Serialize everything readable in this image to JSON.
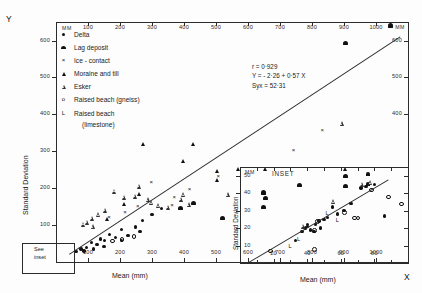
{
  "figure": {
    "y_axis_symbol": "Y",
    "x_axis_symbol": "X"
  },
  "main": {
    "unit_top_left": "MM",
    "unit_top_right": "MM",
    "xlabel": "Mean  (mm)",
    "ylabel": "Standard   Deviation",
    "top_ticks": [
      "100",
      "200",
      "300",
      "400",
      "500",
      "600",
      "700",
      "800",
      "900",
      "1000"
    ],
    "bottom_ticks": [
      "100",
      "200",
      "300",
      "400",
      "500",
      "600",
      "700",
      "800",
      "900",
      "1000"
    ],
    "left_ticks": [
      "600",
      "500",
      "400",
      "300",
      "200",
      "100"
    ],
    "right_ticks": [
      "600",
      "500",
      "400"
    ],
    "see_inset_line1": "See",
    "see_inset_line2": "inset"
  },
  "inset": {
    "title": "INSET",
    "unit": "MM",
    "xlabel": "Mean (mm)",
    "ylabel": "Standard   Deviation",
    "y_ticks": [
      "50",
      "40",
      "30",
      "20",
      "10"
    ],
    "x_ticks": [
      "20",
      "40",
      "60",
      "80"
    ]
  },
  "legend": {
    "items": [
      {
        "symbol": "●",
        "cls": "m-delta-leg",
        "label": "Delta"
      },
      {
        "symbol": "⬟",
        "cls": "m-lag-leg",
        "label": "Lag deposit"
      },
      {
        "symbol": "×",
        "cls": "m-ice-leg",
        "label": "Ice - contact"
      },
      {
        "symbol": "▲",
        "cls": "m-mor-leg",
        "label": "Moraine and till"
      },
      {
        "symbol": "△",
        "cls": "m-esk-leg",
        "label": "Esker"
      },
      {
        "symbol": "o",
        "cls": "m-gne-leg",
        "label": "Raised beach (gneiss)"
      },
      {
        "symbol": "L",
        "cls": "m-lim-leg",
        "label": "Raised beach"
      }
    ],
    "last_continuation": "(limestone)"
  },
  "stats": {
    "correlation": "r = 0·929",
    "equation": "Y = - 2·26 + 0·57 X",
    "stderr": "Syx = 52·31"
  },
  "chart_data": {
    "type": "scatter",
    "title": "",
    "xlabel": "Mean (mm)",
    "ylabel": "Standard Deviation",
    "xlim": [
      0,
      1100
    ],
    "ylim": [
      0,
      650
    ],
    "grid": false,
    "regression": {
      "intercept": -2.26,
      "slope": 0.57,
      "r": 0.929,
      "syx": 52.31
    },
    "series": [
      {
        "name": "Delta",
        "marker": "filled-circle",
        "points": [
          [
            62,
            28
          ],
          [
            78,
            35
          ],
          [
            95,
            40
          ],
          [
            110,
            52
          ],
          [
            128,
            48
          ],
          [
            140,
            62
          ],
          [
            152,
            58
          ],
          [
            168,
            75
          ],
          [
            185,
            66
          ],
          [
            205,
            88
          ],
          [
            225,
            72
          ],
          [
            248,
            95
          ],
          [
            270,
            112
          ],
          [
            300,
            128
          ],
          [
            330,
            145
          ],
          [
            205,
            58
          ],
          [
            150,
            42
          ],
          [
            118,
            35
          ],
          [
            88,
            30
          ],
          [
            262,
            82
          ]
        ]
      },
      {
        "name": "Lag deposit",
        "marker": "blob",
        "points": [
          [
            1045,
            640
          ],
          [
            905,
            592
          ],
          [
            648,
            188
          ],
          [
            655,
            172
          ],
          [
            760,
            208
          ],
          [
            905,
            232
          ],
          [
            905,
            205
          ],
          [
            648,
            148
          ],
          [
            975,
            238
          ],
          [
            975,
            212
          ],
          [
            390,
            145
          ],
          [
            520,
            118
          ],
          [
            430,
            160
          ]
        ]
      },
      {
        "name": "Ice-contact",
        "marker": "cross",
        "points": [
          [
            300,
            215
          ],
          [
            420,
            198
          ],
          [
            510,
            232
          ],
          [
            745,
            302
          ],
          [
            835,
            358
          ],
          [
            365,
            155
          ],
          [
            258,
            152
          ],
          [
            218,
            135
          ],
          [
            168,
            122
          ],
          [
            372,
            175
          ]
        ]
      },
      {
        "name": "Moraine and till",
        "marker": "filled-triangle",
        "points": [
          [
            275,
            318
          ],
          [
            430,
            318
          ],
          [
            398,
            272
          ],
          [
            505,
            245
          ],
          [
            570,
            252
          ],
          [
            655,
            250
          ],
          [
            505,
            220
          ],
          [
            262,
            182
          ],
          [
            215,
            155
          ],
          [
            160,
            115
          ],
          [
            905,
            252
          ]
        ]
      },
      {
        "name": "Esker",
        "marker": "open-triangle",
        "points": [
          [
            185,
            192
          ],
          [
            215,
            175
          ],
          [
            248,
            178
          ],
          [
            262,
            205
          ],
          [
            290,
            168
          ],
          [
            300,
            160
          ],
          [
            322,
            152
          ],
          [
            352,
            148
          ],
          [
            392,
            170
          ],
          [
            400,
            182
          ],
          [
            418,
            155
          ],
          [
            540,
            182
          ],
          [
            895,
            375
          ],
          [
            155,
            140
          ],
          [
            135,
            128
          ],
          [
            115,
            118
          ],
          [
            98,
            108
          ],
          [
            88,
            102
          ],
          [
            118,
            95
          ]
        ]
      },
      {
        "name": "Raised beach (gneiss)",
        "marker": "open-circle",
        "points": [
          [
            175,
            58
          ],
          [
            205,
            62
          ],
          [
            242,
            70
          ]
        ]
      },
      {
        "name": "Raised beach (limestone)",
        "marker": "L",
        "points": []
      }
    ],
    "inset": {
      "type": "scatter",
      "xlabel": "Mean (mm)",
      "ylabel": "Standard Deviation",
      "xlim": [
        0,
        100
      ],
      "ylim": [
        0,
        55
      ],
      "regression": {
        "slope": 0.57,
        "intercept": -2.26
      },
      "series": [
        {
          "name": "Delta",
          "marker": "filled-circle",
          "points": [
            [
              33,
              13
            ],
            [
              37,
              18
            ],
            [
              39,
              20
            ],
            [
              40,
              22
            ],
            [
              42,
              19
            ],
            [
              45,
              22
            ],
            [
              47,
              24
            ],
            [
              48,
              20
            ],
            [
              50,
              25
            ],
            [
              52,
              26
            ],
            [
              55,
              32
            ],
            [
              58,
              28
            ],
            [
              62,
              30
            ],
            [
              66,
              34
            ],
            [
              72,
              43
            ],
            [
              75,
              44
            ],
            [
              80,
              45
            ],
            [
              86,
              27
            ],
            [
              40,
              21
            ],
            [
              44,
              18
            ]
          ]
        },
        {
          "name": "Esker",
          "marker": "open-triangle",
          "points": [
            [
              38,
              21
            ],
            [
              56,
              35
            ],
            [
              73,
              45
            ],
            [
              78,
              46
            ]
          ]
        },
        {
          "name": "Raised beach (gneiss)",
          "marker": "open-circle",
          "points": [
            [
              18,
              7
            ],
            [
              44,
              19
            ],
            [
              46,
              24
            ],
            [
              62,
              29
            ],
            [
              68,
              26
            ],
            [
              70,
              26
            ],
            [
              78,
              42
            ],
            [
              88,
              38
            ],
            [
              96,
              34
            ],
            [
              44,
              8
            ]
          ]
        },
        {
          "name": "Raised beach (limestone)",
          "marker": "L",
          "points": [
            [
              30,
              9
            ],
            [
              35,
              13
            ],
            [
              52,
              28
            ],
            [
              58,
              24
            ]
          ]
        }
      ]
    }
  }
}
